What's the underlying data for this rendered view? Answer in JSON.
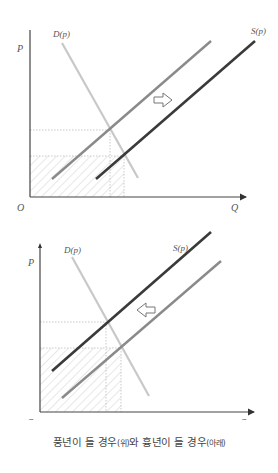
{
  "diagrams": [
    {
      "id": "bumper-harvest",
      "labels": {
        "y_axis": "P",
        "x_axis": "Q",
        "origin": "O",
        "demand": "D(p)",
        "supply": "S(p)"
      },
      "shift_direction": "right",
      "colors": {
        "axis": "#444444",
        "demand": "#c8c8c8",
        "supply_original": "#8a8a8a",
        "supply_new": "#3a3a3a",
        "guide": "#bbbbbb",
        "hatch": "#cfcfcf"
      }
    },
    {
      "id": "poor-harvest",
      "labels": {
        "y_axis": "P",
        "x_axis": "Q",
        "origin": "O",
        "demand": "D(p)",
        "supply": "S(p)"
      },
      "shift_direction": "left",
      "colors": {
        "axis": "#444444",
        "demand": "#c8c8c8",
        "supply_original": "#8a8a8a",
        "supply_new": "#3a3a3a",
        "guide": "#bbbbbb",
        "hatch": "#cfcfcf"
      }
    }
  ],
  "caption": {
    "part1": "풍년이 들 경우",
    "part2": "(위)",
    "part3": "와 흉년이 들 경우",
    "part4": "(아래)"
  }
}
